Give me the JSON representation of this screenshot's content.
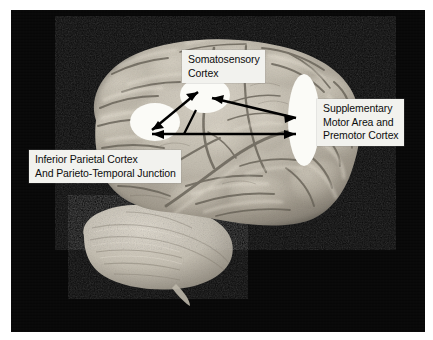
{
  "figure": {
    "type": "anatomical-photo-diagram",
    "background_color": "#060606",
    "label_box_color": "#f2f2ee",
    "label_text_color": "#0d0d0d",
    "marker_color": "#ffffff",
    "arrow_color": "#000000"
  },
  "labels": [
    {
      "name": "somatosensory-cortex",
      "lines": [
        "Somatosensory",
        "Cortex"
      ],
      "text": "Somatosensory\nCortex"
    },
    {
      "name": "supplementary-motor-area",
      "lines": [
        "Supplementary",
        "Motor Area and",
        "Premotor Cortex"
      ],
      "text": "Supplementary\nMotor Area and\nPremotor Cortex"
    },
    {
      "name": "inferior-parietal-cortex",
      "lines": [
        "Inferior Parietal Cortex",
        "And Parieto-Temporal Junction"
      ],
      "text": "Inferior Parietal Cortex\nAnd Parieto-Temporal Junction"
    }
  ],
  "regions": [
    {
      "name": "somatosensory-cortex-marker",
      "shape": "ellipse",
      "cx": 205,
      "cy": 95,
      "rx": 25,
      "ry": 18
    },
    {
      "name": "inferior-parietal-marker",
      "shape": "ellipse",
      "cx": 155,
      "cy": 122,
      "rx": 25,
      "ry": 19
    },
    {
      "name": "supplementary-motor-marker",
      "shape": "ellipse",
      "cx": 304,
      "cy": 120,
      "rx": 16,
      "ry": 46
    }
  ],
  "connections": [
    {
      "name": "parietal-somatosensory-bidirectional",
      "from": "inferior-parietal-marker",
      "to": "somatosensory-cortex-marker",
      "heads": "both"
    },
    {
      "name": "sma-to-somatosensory",
      "from": "supplementary-motor-marker",
      "to": "somatosensory-cortex-marker",
      "heads": "both"
    },
    {
      "name": "parietal-sma-bidirectional",
      "from": "inferior-parietal-marker",
      "to": "supplementary-motor-marker",
      "heads": "both"
    }
  ]
}
